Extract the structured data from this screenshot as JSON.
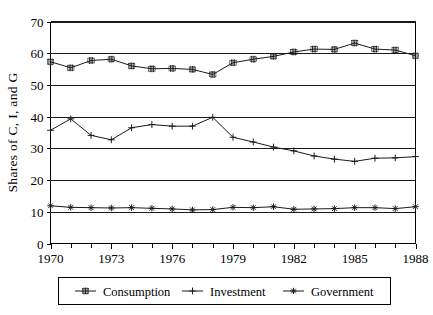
{
  "chart_data": {
    "type": "line",
    "title": "",
    "xlabel": "",
    "ylabel": "Shares of C, I, and G",
    "xlim": [
      1970,
      1988
    ],
    "ylim": [
      0,
      70
    ],
    "ytick_labels": [
      "0",
      "10",
      "20",
      "30",
      "40",
      "50",
      "60",
      "70"
    ],
    "ytick_values": [
      0,
      10,
      20,
      30,
      40,
      50,
      60,
      70
    ],
    "xtick_labels": [
      "1970",
      "1973",
      "1976",
      "1979",
      "1982",
      "1985",
      "1988"
    ],
    "xtick_values": [
      1970,
      1973,
      1976,
      1979,
      1982,
      1985,
      1988
    ],
    "minor_x_ticks": [
      1971,
      1972,
      1974,
      1975,
      1977,
      1978,
      1980,
      1981,
      1983,
      1984,
      1986,
      1987
    ],
    "grid": "horizontal",
    "legend_position": "bottom",
    "x": [
      1970,
      1971,
      1972,
      1973,
      1974,
      1975,
      1976,
      1977,
      1978,
      1979,
      1980,
      1981,
      1982,
      1983,
      1984,
      1985,
      1986,
      1987,
      1988
    ],
    "series": [
      {
        "name": "Consumption",
        "marker": "square-hash",
        "values": [
          57.3,
          55.4,
          57.7,
          58.1,
          56.0,
          55.1,
          55.2,
          54.9,
          53.3,
          57.0,
          58.1,
          59.0,
          60.4,
          61.3,
          61.2,
          63.2,
          61.3,
          61.0,
          59.2
        ]
      },
      {
        "name": "Investment",
        "marker": "plus",
        "values": [
          35.7,
          39.3,
          34.1,
          32.7,
          36.5,
          37.5,
          37.0,
          37.0,
          39.8,
          33.5,
          32.0,
          30.4,
          29.2,
          27.6,
          26.6,
          25.9,
          26.9,
          27.0,
          27.4
        ]
      },
      {
        "name": "Government",
        "marker": "asterisk",
        "values": [
          11.9,
          11.4,
          11.3,
          11.2,
          11.3,
          11.1,
          10.9,
          10.6,
          10.7,
          11.4,
          11.3,
          11.6,
          10.8,
          10.9,
          11.0,
          11.3,
          11.3,
          11.0,
          11.6
        ]
      }
    ]
  },
  "legend": {
    "items": [
      {
        "label": "Consumption"
      },
      {
        "label": "Investment"
      },
      {
        "label": "Government"
      }
    ]
  },
  "colors": {
    "axis": "#000000",
    "grid": "#000000",
    "series": "#1a1a1a",
    "background": "#ffffff"
  }
}
